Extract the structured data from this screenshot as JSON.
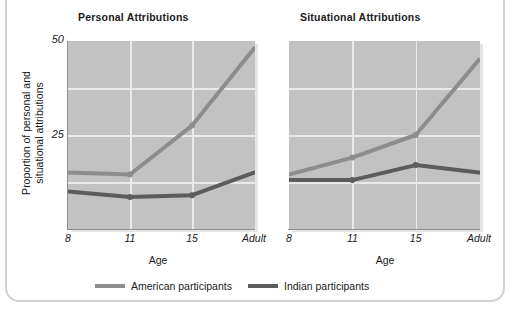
{
  "figure": {
    "cut_off_top_text": "",
    "ylabel_line1": "Proportion of personal and",
    "ylabel_line2": "situational attributions",
    "xlabel": "Age"
  },
  "legend": {
    "position": "bottom",
    "items": [
      {
        "label": "American participants",
        "color": "#8d8d8d",
        "key": "american"
      },
      {
        "label": "Indian participants",
        "color": "#5c5c5c",
        "key": "indian"
      }
    ]
  },
  "chart_data": [
    {
      "type": "line",
      "title": "Personal Attributions",
      "xlabel": "Age",
      "ylabel": "Proportion of personal and situational attributions",
      "categories": [
        "8",
        "11",
        "15",
        "Adult"
      ],
      "ylim": [
        0,
        50
      ],
      "yticks": [
        25,
        50
      ],
      "ytick_labels": [
        "25",
        "50"
      ],
      "grid": true,
      "series": [
        {
          "name": "American participants",
          "color": "#8d8d8d",
          "values": [
            15,
            14.5,
            27.5,
            48
          ]
        },
        {
          "name": "Indian participants",
          "color": "#5c5c5c",
          "values": [
            10,
            8.5,
            9,
            15
          ]
        }
      ]
    },
    {
      "type": "line",
      "title": "Situational Attributions",
      "xlabel": "Age",
      "ylabel": "",
      "categories": [
        "8",
        "11",
        "15",
        "Adult"
      ],
      "ylim": [
        0,
        50
      ],
      "yticks": [
        25,
        50
      ],
      "ytick_labels": [
        "25",
        "50"
      ],
      "grid": true,
      "series": [
        {
          "name": "American participants",
          "color": "#8d8d8d",
          "values": [
            14.5,
            19,
            25,
            45
          ]
        },
        {
          "name": "Indian participants",
          "color": "#5c5c5c",
          "values": [
            13,
            13,
            17,
            15
          ]
        }
      ]
    }
  ]
}
